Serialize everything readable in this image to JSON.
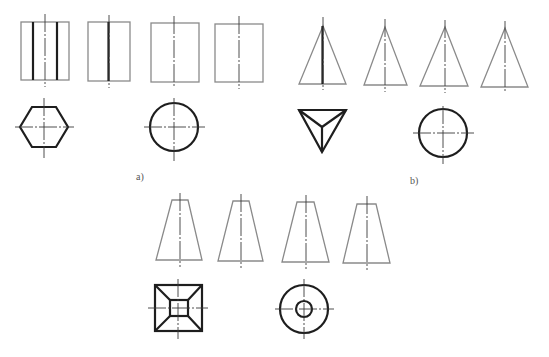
{
  "figure": {
    "groups": [
      {
        "id": "a",
        "label": "a)",
        "label_pos": [
          140,
          177
        ],
        "front_views": [
          {
            "type": "rect",
            "x": 21,
            "y": 22,
            "w": 48,
            "h": 58,
            "bold_lines_x": [
              33,
              57
            ],
            "center_x": 45
          },
          {
            "type": "rect",
            "x": 88,
            "y": 22,
            "w": 42,
            "h": 59,
            "bold_lines_x": [
              108
            ],
            "center_x": 109
          },
          {
            "type": "rect",
            "x": 151,
            "y": 23,
            "w": 48,
            "h": 59,
            "bold_lines_x": [],
            "center_x": 174
          },
          {
            "type": "rect",
            "x": 215,
            "y": 24,
            "w": 48,
            "h": 58,
            "bold_lines_x": [],
            "center_x": 239
          }
        ],
        "top_views": [
          {
            "type": "hexagon",
            "cx": 44,
            "cy": 127,
            "rx": 24,
            "ry": 20
          },
          {
            "type": "circle",
            "cx": 174,
            "cy": 127,
            "r": 24
          }
        ]
      },
      {
        "id": "b",
        "label": "b)",
        "label_pos": [
          413,
          181
        ],
        "front_views": [
          {
            "type": "triangle",
            "apex": [
              323,
              26
            ],
            "base_left": 299,
            "base_right": 346,
            "base_y": 84,
            "bold_center": true
          },
          {
            "type": "triangle",
            "apex": [
              385,
              27
            ],
            "base_left": 364,
            "base_right": 407,
            "base_y": 85,
            "bold_center": false
          },
          {
            "type": "triangle",
            "apex": [
              445,
              27
            ],
            "base_left": 420,
            "base_right": 468,
            "base_y": 86,
            "bold_center": false
          },
          {
            "type": "triangle",
            "apex": [
              505,
              28
            ],
            "base_left": 481,
            "base_right": 528,
            "base_y": 87,
            "bold_center": false
          }
        ],
        "top_views": [
          {
            "type": "triangular-pyramid-top",
            "points": [
              [
                299,
                110
              ],
              [
                346,
                110
              ],
              [
                322,
                152
              ]
            ],
            "center": [
              322,
              127
            ]
          },
          {
            "type": "circle",
            "cx": 443,
            "cy": 133,
            "r": 24
          }
        ]
      },
      {
        "id": "c",
        "label": "",
        "front_views": [
          {
            "type": "trapezoid",
            "top_left": 172,
            "top_right": 188,
            "top_y": 200,
            "bottom_left": 156,
            "bottom_right": 202,
            "bottom_y": 260,
            "center_x": 180
          },
          {
            "type": "trapezoid",
            "top_left": 233,
            "top_right": 249,
            "top_y": 201,
            "bottom_left": 218,
            "bottom_right": 263,
            "bottom_y": 261,
            "center_x": 241
          },
          {
            "type": "trapezoid",
            "top_left": 297,
            "top_right": 314,
            "top_y": 202,
            "bottom_left": 282,
            "bottom_right": 329,
            "bottom_y": 262,
            "center_x": 306
          },
          {
            "type": "trapezoid",
            "top_left": 357,
            "top_right": 376,
            "top_y": 204,
            "bottom_left": 343,
            "bottom_right": 390,
            "bottom_y": 263,
            "center_x": 367
          }
        ],
        "top_views": [
          {
            "type": "frustum-square-top",
            "outer": [
              155,
              285,
              202,
              331
            ],
            "inner": [
              170,
              300,
              188,
              316
            ],
            "center": [
              178,
              308
            ]
          },
          {
            "type": "annulus",
            "cx": 304,
            "cy": 309,
            "R": 24,
            "r": 8
          }
        ]
      }
    ]
  },
  "labels": {
    "a": "a)",
    "b": "b)"
  }
}
